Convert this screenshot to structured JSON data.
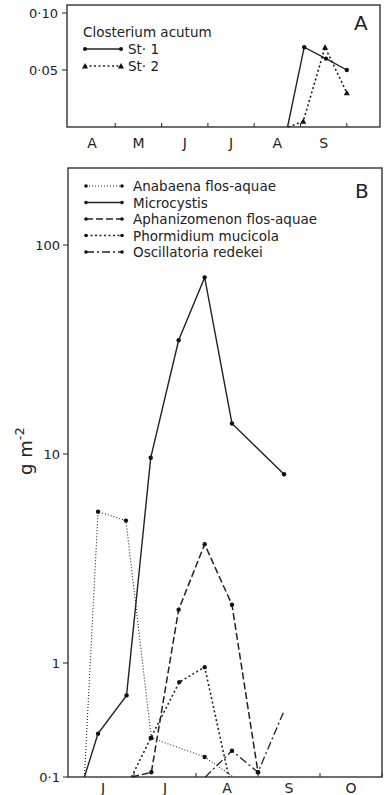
{
  "chart_data": [
    {
      "panel": "A",
      "type": "line",
      "title": "Closterium acutum",
      "panel_label": "A",
      "xlabel": "",
      "ylabel": "",
      "x_categories": [
        "A",
        "M",
        "J",
        "J",
        "A",
        "S"
      ],
      "ylim": [
        0,
        0.11
      ],
      "y_ticks": [
        {
          "value": 0.1,
          "label": "0·10"
        },
        {
          "value": 0.05,
          "label": "0·05"
        }
      ],
      "legend_position": "top-left",
      "series": [
        {
          "name": "St· 1",
          "style": "solid",
          "marker": "circle",
          "points": [
            {
              "month": 4.72,
              "value": 0
            },
            {
              "month": 5.08,
              "value": 0.07
            },
            {
              "month": 5.55,
              "value": 0.06
            },
            {
              "month": 6.0,
              "value": 0.05
            }
          ]
        },
        {
          "name": "St· 2",
          "style": "dotted",
          "marker": "triangle",
          "points": [
            {
              "month": 4.74,
              "value": 0
            },
            {
              "month": 5.06,
              "value": 0.005
            },
            {
              "month": 5.53,
              "value": 0.07
            },
            {
              "month": 6.0,
              "value": 0.03
            }
          ]
        }
      ]
    },
    {
      "panel": "B",
      "type": "line",
      "title": "",
      "panel_label": "B",
      "xlabel": "",
      "ylabel": "g m",
      "ylabel_superscript": "-2",
      "y_scale": "log",
      "x_categories": [
        "J",
        "J",
        "A",
        "S",
        "O"
      ],
      "ylim": [
        0.1,
        300
      ],
      "y_ticks": [
        {
          "value": 100,
          "label": "100"
        },
        {
          "value": 10,
          "label": "10"
        },
        {
          "value": 1,
          "label": "1"
        },
        {
          "value": 0.1,
          "label": "0·1"
        }
      ],
      "legend_position": "top-left",
      "series": [
        {
          "name": "Anabaena flos-aquae",
          "style": "fine-dotted",
          "points": [
            {
              "month": 0.2,
              "value": 0.1
            },
            {
              "month": 0.42,
              "value": 5.3
            },
            {
              "month": 0.87,
              "value": 4.8
            },
            {
              "month": 1.28,
              "value": 0.22
            },
            {
              "month": 2.14,
              "value": 0.15
            },
            {
              "month": 2.6,
              "value": 0.1
            }
          ]
        },
        {
          "name": "Microcystis",
          "style": "solid",
          "points": [
            {
              "month": 0.2,
              "value": 0.1
            },
            {
              "month": 0.42,
              "value": 0.24
            },
            {
              "month": 0.88,
              "value": 0.52
            },
            {
              "month": 1.27,
              "value": 9.6
            },
            {
              "month": 1.72,
              "value": 35
            },
            {
              "month": 2.14,
              "value": 70
            },
            {
              "month": 2.58,
              "value": 14
            },
            {
              "month": 3.42,
              "value": 8
            }
          ]
        },
        {
          "name": "Aphanizomenon flos-aquae",
          "style": "dashed",
          "points": [
            {
              "month": 0.97,
              "value": 0.1
            },
            {
              "month": 1.28,
              "value": 0.11
            },
            {
              "month": 1.72,
              "value": 1.8
            },
            {
              "month": 2.14,
              "value": 3.7
            },
            {
              "month": 2.58,
              "value": 1.9
            },
            {
              "month": 3.0,
              "value": 0.11
            }
          ]
        },
        {
          "name": "Phormidium mucicola",
          "style": "dotted",
          "points": [
            {
              "month": 0.96,
              "value": 0.1
            },
            {
              "month": 1.27,
              "value": 0.22
            },
            {
              "month": 1.73,
              "value": 0.68
            },
            {
              "month": 2.14,
              "value": 0.92
            },
            {
              "month": 2.53,
              "value": 0.1
            }
          ]
        },
        {
          "name": "Oscillatoria redekei",
          "style": "dash-dot",
          "points": [
            {
              "month": 2.15,
              "value": 0.1
            },
            {
              "month": 2.58,
              "value": 0.17
            },
            {
              "month": 3.0,
              "value": 0.11
            },
            {
              "month": 3.42,
              "value": 0.38
            }
          ]
        }
      ]
    }
  ]
}
